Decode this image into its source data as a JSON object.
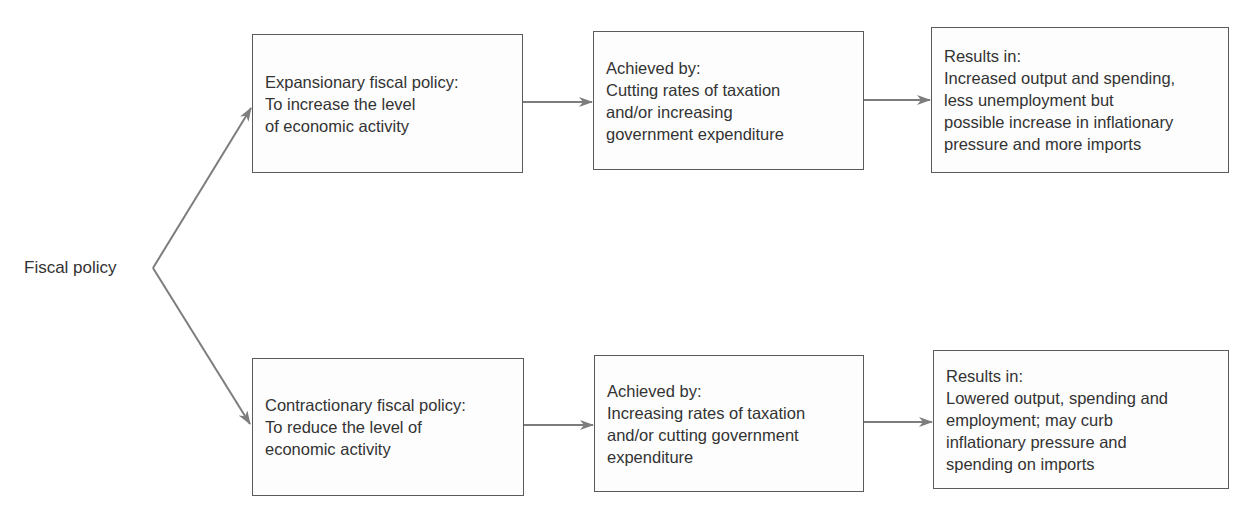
{
  "root": {
    "label": "Fiscal policy"
  },
  "branches": [
    {
      "id": "expansionary",
      "policy": {
        "lines": [
          "Expansionary fiscal policy:",
          "To increase the level",
          "of economic activity"
        ]
      },
      "achieved": {
        "lines": [
          "Achieved by:",
          "Cutting rates of taxation",
          "and/or increasing",
          "government expenditure"
        ]
      },
      "results": {
        "lines": [
          "Results in:",
          "Increased output and spending,",
          "less unemployment but",
          "possible increase in inflationary",
          "pressure and more imports"
        ]
      }
    },
    {
      "id": "contractionary",
      "policy": {
        "lines": [
          "Contractionary fiscal policy:",
          "To reduce the level of",
          "economic activity"
        ]
      },
      "achieved": {
        "lines": [
          "Achieved by:",
          "Increasing rates of taxation",
          "and/or cutting government",
          "expenditure"
        ]
      },
      "results": {
        "lines": [
          "Results in:",
          "Lowered output, spending and",
          "employment; may curb",
          "inflationary pressure and",
          "spending on imports"
        ]
      }
    }
  ],
  "colors": {
    "line": "#7d7d7d",
    "border": "#5a5a5a",
    "text": "#333333"
  }
}
